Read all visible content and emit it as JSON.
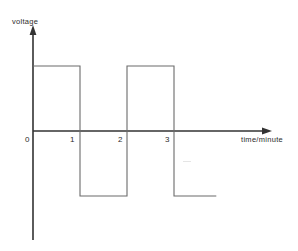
{
  "figure": {
    "name": "voltage-vs-time-square-wave",
    "background_color": "#ffffff",
    "line_color": "#555555",
    "axis_color": "#333333",
    "text_color": "#2b2b2b"
  },
  "axes": {
    "y_axis_label": "voltage",
    "x_axis_label": "time/minute",
    "origin_label": "0"
  },
  "ticks": {
    "x": [
      {
        "label": "0",
        "value": 0
      },
      {
        "label": "1",
        "value": 1
      },
      {
        "label": "2",
        "value": 2
      },
      {
        "label": "3",
        "value": 3
      }
    ]
  },
  "chart_data": {
    "type": "line",
    "title": "",
    "subtitle": "",
    "xlabel": "time/minute",
    "ylabel": "voltage",
    "grid": false,
    "legend": false,
    "legend_position": "none",
    "xlim": [
      0,
      4
    ],
    "ylim": [
      -1.35,
      1.4
    ],
    "xticks": [
      0,
      1,
      2,
      3
    ],
    "xticklabels": [
      "0",
      "1",
      "2",
      "3"
    ],
    "yticks": [],
    "yticklabels": [],
    "waveform": "square",
    "period_minutes": 2,
    "high_level": 1,
    "low_level": -1,
    "series": [
      {
        "name": "voltage",
        "x": [
          0,
          1,
          1,
          2,
          2,
          3,
          3,
          3.9
        ],
        "y": [
          1,
          1,
          -1,
          -1,
          1,
          1,
          -1,
          -1
        ]
      }
    ],
    "annotations": []
  }
}
